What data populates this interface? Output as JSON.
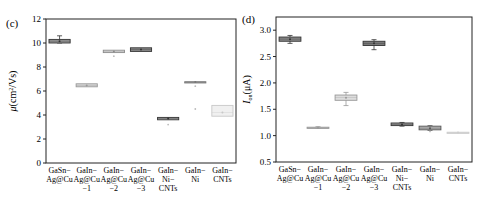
{
  "chart_data": [
    {
      "panel": "(c)",
      "type": "box",
      "title": "",
      "xlabel": "",
      "ylabel": "μ(cm²/Vs)",
      "ylabel_parts": {
        "symbol": "μ",
        "unit": "(cm",
        "sup": "2",
        "unit_end": "/Vs)"
      },
      "ylim": [
        0,
        12
      ],
      "yticks": [
        0,
        2,
        4,
        6,
        8,
        10,
        12
      ],
      "categories": [
        [
          "GaSn−",
          "Ag@Cu"
        ],
        [
          "GaIn−",
          "Ag@Cu",
          "−1"
        ],
        [
          "GaIn−",
          "Ag@Cu",
          "−2"
        ],
        [
          "GaIn−",
          "Ag@Cu",
          "−3"
        ],
        [
          "GaIn−",
          "Ni−",
          "CNTs"
        ],
        [
          "GaIn−",
          "Ni"
        ],
        [
          "GaIn−",
          "CNTs"
        ]
      ],
      "boxes": [
        {
          "q1": 10.0,
          "median": 10.15,
          "q3": 10.3,
          "min": 10.0,
          "max": 10.6,
          "fill": "#9a9a9a",
          "stroke": "#333333",
          "outliers": []
        },
        {
          "q1": 6.35,
          "median": 6.45,
          "q3": 6.6,
          "min": 6.35,
          "max": 6.6,
          "fill": "#d8d8d8",
          "stroke": "#999999",
          "outliers": []
        },
        {
          "q1": 9.2,
          "median": 9.3,
          "q3": 9.4,
          "min": 9.2,
          "max": 9.4,
          "fill": "#e2e2e2",
          "stroke": "#8a8a8a",
          "outliers": [
            8.9
          ]
        },
        {
          "q1": 9.3,
          "median": 9.45,
          "q3": 9.6,
          "min": 9.3,
          "max": 9.6,
          "fill": "#888888",
          "stroke": "#333333",
          "outliers": []
        },
        {
          "q1": 3.6,
          "median": 3.7,
          "q3": 3.8,
          "min": 3.6,
          "max": 3.8,
          "fill": "#a8a8a8",
          "stroke": "#333333",
          "outliers": [
            3.2
          ]
        },
        {
          "q1": 6.73,
          "median": 6.75,
          "q3": 6.77,
          "min": 6.73,
          "max": 6.77,
          "fill": "#bbbbbb",
          "stroke": "#777777",
          "outliers": [
            6.4,
            4.5
          ]
        },
        {
          "q1": 3.9,
          "median": 4.2,
          "q3": 4.8,
          "min": 3.9,
          "max": 4.8,
          "fill": "#f0f0f0",
          "stroke": "#c8c8c8",
          "outliers": []
        }
      ],
      "grid": false,
      "legend": null
    },
    {
      "panel": "(d)",
      "type": "box",
      "title": "",
      "xlabel": "",
      "ylabel": "Ion(μA)",
      "ylabel_parts": {
        "symbol": "I",
        "sub": "on",
        "unit": "(μA)"
      },
      "ylim": [
        0.5,
        3.25
      ],
      "yticks": [
        0.5,
        1.0,
        1.5,
        2.0,
        2.5,
        3.0
      ],
      "ytick_labels": [
        "0.5",
        "1.0",
        "1.5",
        "2.0",
        "2.5",
        "3.0"
      ],
      "categories": [
        [
          "GaSn−",
          "Ag@Cu"
        ],
        [
          "GaIn−",
          "Ag@Cu",
          "−1"
        ],
        [
          "GaIn−",
          "Ag@Cu",
          "−2"
        ],
        [
          "GaIn−",
          "Ag@Cu",
          "−3"
        ],
        [
          "GaIn−",
          "Ni−",
          "CNTs"
        ],
        [
          "GaIn−",
          "Ni"
        ],
        [
          "GaIn−",
          "CNTs"
        ]
      ],
      "boxes": [
        {
          "q1": 2.79,
          "median": 2.83,
          "q3": 2.87,
          "min": 2.75,
          "max": 2.9,
          "fill": "#8a8a8a",
          "stroke": "#333333",
          "outliers": []
        },
        {
          "q1": 1.14,
          "median": 1.15,
          "q3": 1.16,
          "min": 1.14,
          "max": 1.17,
          "fill": "#cfcfcf",
          "stroke": "#999999",
          "outliers": []
        },
        {
          "q1": 1.67,
          "median": 1.72,
          "q3": 1.77,
          "min": 1.57,
          "max": 1.82,
          "fill": "#dddddd",
          "stroke": "#999999",
          "outliers": []
        },
        {
          "q1": 2.71,
          "median": 2.75,
          "q3": 2.79,
          "min": 2.63,
          "max": 2.82,
          "fill": "#7a7a7a",
          "stroke": "#333333",
          "outliers": []
        },
        {
          "q1": 1.19,
          "median": 1.21,
          "q3": 1.24,
          "min": 1.18,
          "max": 1.25,
          "fill": "#9a9a9a",
          "stroke": "#333333",
          "outliers": []
        },
        {
          "q1": 1.11,
          "median": 1.14,
          "q3": 1.18,
          "min": 1.1,
          "max": 1.19,
          "fill": "#b0b0b0",
          "stroke": "#555555",
          "outliers": [
            1.08
          ]
        },
        {
          "q1": 1.055,
          "median": 1.06,
          "q3": 1.065,
          "min": 1.055,
          "max": 1.065,
          "fill": "#e8e8e8",
          "stroke": "#cccccc",
          "outliers": []
        }
      ],
      "grid": false,
      "legend": null
    }
  ]
}
